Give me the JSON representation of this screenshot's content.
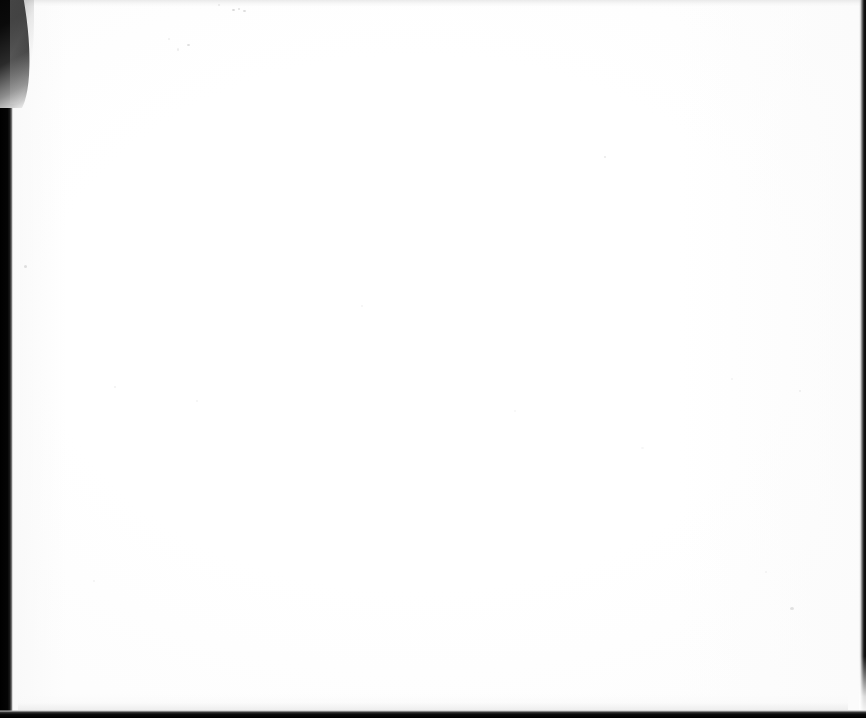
{
  "document": {
    "kind": "scanned-page",
    "page_content": "",
    "page_description": "Blank scanned page",
    "background_color": "#ffffff",
    "paper_tint": "#fdfdfd"
  },
  "canvas": {
    "width": 866,
    "height": 718
  },
  "edges": {
    "left_bar": {
      "name": "scanner-bed-left-margin",
      "color": "#000000",
      "width": 13
    },
    "right_bar": {
      "name": "scanner-bed-right-edge",
      "color": "#0a0a0a",
      "width": 7
    },
    "bottom_bar": {
      "name": "scanner-bed-bottom-edge",
      "color": "#000000",
      "height": 8
    },
    "top_band": {
      "name": "page-top-shadow",
      "color": "#e9e9e9",
      "height": 9
    },
    "corner_curl": {
      "name": "page-curl-top-left",
      "color": "#000000",
      "width": 34,
      "height": 108
    }
  },
  "artifacts": {
    "label": "scan dust specks",
    "specks": [
      {
        "x": 232,
        "y": 9,
        "w": 3,
        "h": 2,
        "opacity": 0.38
      },
      {
        "x": 238,
        "y": 8,
        "w": 2,
        "h": 2,
        "opacity": 0.3
      },
      {
        "x": 243,
        "y": 10,
        "w": 3,
        "h": 2,
        "opacity": 0.34
      },
      {
        "x": 187,
        "y": 44,
        "w": 3,
        "h": 2,
        "opacity": 0.32
      },
      {
        "x": 177,
        "y": 48,
        "w": 2,
        "h": 3,
        "opacity": 0.18
      },
      {
        "x": 218,
        "y": 4,
        "w": 2,
        "h": 2,
        "opacity": 0.2
      },
      {
        "x": 168,
        "y": 38,
        "w": 2,
        "h": 2,
        "opacity": 0.16
      },
      {
        "x": 24,
        "y": 265,
        "w": 3,
        "h": 3,
        "opacity": 0.3
      },
      {
        "x": 604,
        "y": 156,
        "w": 2,
        "h": 2,
        "opacity": 0.22
      },
      {
        "x": 790,
        "y": 607,
        "w": 4,
        "h": 3,
        "opacity": 0.28
      },
      {
        "x": 799,
        "y": 390,
        "w": 2,
        "h": 2,
        "opacity": 0.16
      },
      {
        "x": 114,
        "y": 386,
        "w": 2,
        "h": 2,
        "opacity": 0.14
      },
      {
        "x": 196,
        "y": 400,
        "w": 2,
        "h": 2,
        "opacity": 0.13
      },
      {
        "x": 361,
        "y": 305,
        "w": 2,
        "h": 2,
        "opacity": 0.12
      },
      {
        "x": 731,
        "y": 378,
        "w": 2,
        "h": 2,
        "opacity": 0.12
      },
      {
        "x": 514,
        "y": 410,
        "w": 2,
        "h": 2,
        "opacity": 0.1
      },
      {
        "x": 93,
        "y": 580,
        "w": 2,
        "h": 2,
        "opacity": 0.12
      },
      {
        "x": 765,
        "y": 571,
        "w": 2,
        "h": 2,
        "opacity": 0.12
      },
      {
        "x": 641,
        "y": 447,
        "w": 3,
        "h": 2,
        "opacity": 0.1
      }
    ]
  }
}
